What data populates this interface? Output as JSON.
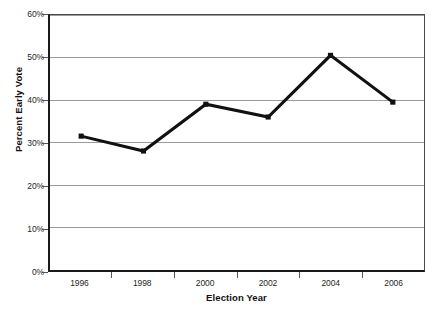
{
  "chart_data": {
    "type": "line",
    "title": "",
    "subtitle": "",
    "xlabel": "Election Year",
    "ylabel": "Percent Early Vote",
    "categories": [
      "1996",
      "1998",
      "2000",
      "2002",
      "2004",
      "2006"
    ],
    "values": [
      31.5,
      28.0,
      39.0,
      36.0,
      50.5,
      39.5
    ],
    "series": [
      {
        "name": "Percent Early Vote",
        "values": [
          31.5,
          28.0,
          39.0,
          36.0,
          50.5,
          39.5
        ]
      }
    ],
    "ylim": [
      0,
      60
    ],
    "ytick_values": [
      0,
      10,
      20,
      30,
      40,
      50,
      60
    ],
    "ytick_labels": [
      "0%",
      "10%",
      "20%",
      "30%",
      "40%",
      "50%",
      "60%"
    ],
    "xtick_labels": [
      "1996",
      "1998",
      "2000",
      "2002",
      "2004",
      "2006"
    ],
    "grid": "horizontal",
    "legend": "none",
    "annotations": [],
    "marker": "square",
    "line_color": "#111111",
    "grid_color": "#9a9a9a",
    "axis_color": "#1a1a1a",
    "background_color": "#ffffff"
  }
}
